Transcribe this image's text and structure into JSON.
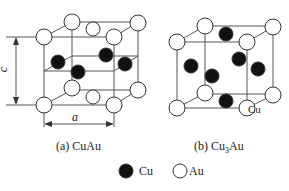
{
  "figure": {
    "panels": [
      {
        "id": "a",
        "caption": "(a)  CuAu",
        "structure": "tetragonal L1_0 ordered"
      },
      {
        "id": "b",
        "caption_prefix": "(b) Cu",
        "caption_sub": "3",
        "caption_suffix": "Au",
        "atom_label": "Cu"
      }
    ],
    "dimensions": {
      "a": "a",
      "c": "c"
    },
    "legend": [
      {
        "label": "Cu",
        "fill": "#111111"
      },
      {
        "label": "Au",
        "fill": "#ffffff"
      }
    ]
  },
  "colors": {
    "line": "#444444",
    "cu": "#111111",
    "au": "#ffffff"
  }
}
